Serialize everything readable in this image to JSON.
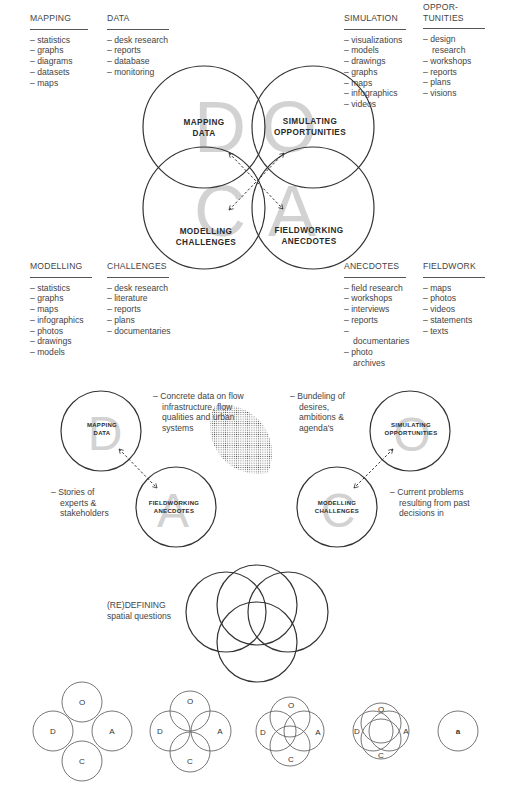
{
  "top_columns": [
    {
      "id": "mapping",
      "heading": "MAPPING",
      "items": [
        "statistics",
        "graphs",
        "diagrams",
        "datasets",
        "maps"
      ]
    },
    {
      "id": "data",
      "heading": "DATA",
      "items": [
        "desk research",
        "reports",
        "database",
        "monitoring"
      ]
    },
    {
      "id": "simulation",
      "heading": "SIMULATION",
      "items": [
        "visualizations",
        "models",
        "drawings",
        "graphs",
        "maps",
        "infographics",
        "videos"
      ]
    },
    {
      "id": "opportunities",
      "heading": "OPPOR-\nTUNITIES",
      "items": [
        "design research",
        "workshops",
        "reports",
        "plans",
        "visions"
      ]
    }
  ],
  "bottom_columns": [
    {
      "id": "modelling",
      "heading": "MODELLING",
      "items": [
        "statistics",
        "graphs",
        "maps",
        "infographics",
        "photos",
        "drawings",
        "models"
      ]
    },
    {
      "id": "challenges",
      "heading": "CHALLENGES",
      "items": [
        "desk research",
        "literature",
        "reports",
        "plans",
        "documentaries"
      ]
    },
    {
      "id": "anecdotes",
      "heading": "ANECDOTES",
      "items": [
        "field research",
        "workshops",
        "interviews",
        "reports",
        "documentaries",
        "photo archives"
      ]
    },
    {
      "id": "fieldwork",
      "heading": "FIELDWORK",
      "items": [
        "maps",
        "photos",
        "videos",
        "statements",
        "texts"
      ]
    }
  ],
  "main_diagram": {
    "circles": [
      {
        "letter": "D",
        "label1": "MAPPING",
        "label2": "DATA"
      },
      {
        "letter": "O",
        "label1": "SIMULATING",
        "label2": "OPPORTUNITIES"
      },
      {
        "letter": "C",
        "label1": "MODELLING",
        "label2": "CHALLENGES"
      },
      {
        "letter": "A",
        "label1": "FIELDWORKING",
        "label2": "ANECDOTES"
      }
    ]
  },
  "pair_diagrams": {
    "left": {
      "top": {
        "letter": "D",
        "label1": "MAPPING",
        "label2": "DATA"
      },
      "bottom": {
        "letter": "A",
        "label1": "FIELDWORKING",
        "label2": "ANECDOTES"
      },
      "note_top": "Concrete data on flow infrastructure, flow qualities and urban systems",
      "note_bottom": "Stories of experts & stakeholders"
    },
    "right": {
      "top": {
        "letter": "O",
        "label1": "SIMULATING",
        "label2": "OPPORTUNITIES"
      },
      "bottom": {
        "letter": "C",
        "label1": "MODELLING",
        "label2": "CHALLENGES"
      },
      "note_top": "Bundeling of desires, ambitions & agenda's",
      "note_bottom": "Current problems resulting from past decisions in"
    }
  },
  "overlap_diagram": {
    "label_line1": "(RE)DEFINING",
    "label_line2": "spatial questions"
  },
  "sequence": {
    "letters": {
      "top": "O",
      "left": "D",
      "right": "A",
      "bottom": "C"
    },
    "final_glyph": "a"
  },
  "colors": {
    "stroke": "#333333",
    "letter": "#cfcfcf",
    "text": "#444444",
    "dots": "#555555"
  }
}
